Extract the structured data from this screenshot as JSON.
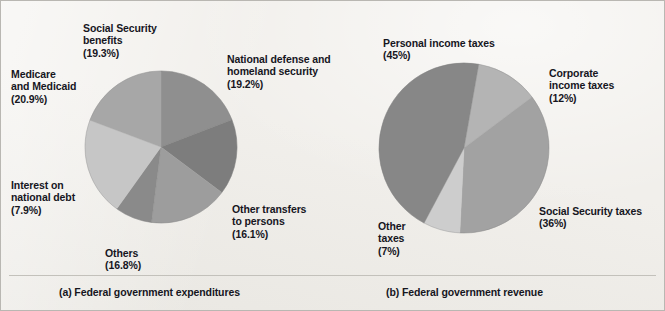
{
  "figure": {
    "background_color": "#f1efeb",
    "border_color": "#b9b7b2",
    "text_color": "#16161e"
  },
  "panel_a": {
    "caption": "(a) Federal government expenditures",
    "labels": {
      "social_security": "Social Security\nbenefits\n(19.3%)",
      "medicare": "Medicare\nand Medicaid\n(20.9%)",
      "interest": "Interest on\nnational debt\n(7.9%)",
      "others": "Others\n(16.8%)",
      "defense": "National defense and\nhomeland security\n(19.2%)",
      "transfers": "Other transfers\nto persons\n(16.1%)"
    }
  },
  "panel_b": {
    "caption": "(b) Federal government revenue",
    "labels": {
      "personal": "Personal income taxes\n(45%)",
      "corporate": "Corporate\nincome taxes\n(12%)",
      "social_security": "Social Security taxes\n(36%)",
      "other": "Other\ntaxes\n(7%)"
    }
  },
  "chart_data": [
    {
      "type": "pie",
      "title": "(a) Federal government expenditures",
      "center": [
        160,
        146
      ],
      "radius": 76,
      "start_angle_deg": -90,
      "direction": "clockwise",
      "legend": "labels placed around pie",
      "categories": [
        "National defense and homeland security",
        "Other transfers to persons",
        "Others",
        "Interest on national debt",
        "Medicare and Medicaid",
        "Social Security benefits"
      ],
      "values": [
        19.2,
        16.1,
        16.8,
        7.9,
        20.9,
        19.3
      ],
      "value_labels": [
        "(19.2%)",
        "(16.1%)",
        "(16.8%)",
        "(7.9%)",
        "(20.9%)",
        "(19.3%)"
      ],
      "colors": [
        "#8f8f8f",
        "#7d7d7d",
        "#9d9d9d",
        "#8a8a8a",
        "#c6c6c6",
        "#a7a7a7"
      ],
      "units": "percent"
    },
    {
      "type": "pie",
      "title": "(b) Federal government revenue",
      "center": [
        463,
        147
      ],
      "radius": 85,
      "start_angle_deg": -80,
      "direction": "clockwise",
      "legend": "labels placed around pie",
      "categories": [
        "Corporate income taxes",
        "Social Security taxes",
        "Other taxes",
        "Personal income taxes"
      ],
      "values": [
        12,
        36,
        7,
        45
      ],
      "value_labels": [
        "(12%)",
        "(36%)",
        "(7%)",
        "(45%)"
      ],
      "colors": [
        "#b4b4b4",
        "#a2a2a2",
        "#cdcdcd",
        "#878787"
      ],
      "units": "percent"
    }
  ]
}
